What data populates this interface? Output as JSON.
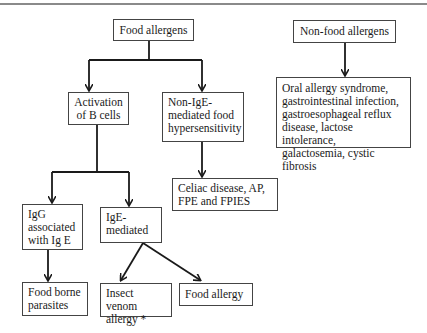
{
  "diagram": {
    "nodes": {
      "food_allergens": "Food allergens",
      "non_food_allergens": "Non-food allergens",
      "activation_b_cells": "Activation\nof B cells",
      "non_ige": "Non-IgE-\nmediated food\nhypersensitivity",
      "non_food_conditions": "Oral allergy syndrome,\ngastrointestinal infection,\ngastroesophageal reflux\ndisease, lactose intolerance,\ngalactosemia, cystic fibrosis",
      "non_ige_conditions": "Celiac disease, AP,\nFPE and FPIES",
      "igg": "IgG\nassociated\nwith Ig E",
      "ige": "IgE-\nmediated",
      "food_borne_parasites": "Food borne\nparasites",
      "insect_venom": "Insect venom\nallergy *",
      "food_allergy": "Food allergy"
    },
    "edges": [
      {
        "from": "Food allergens",
        "to": "Activation of B cells"
      },
      {
        "from": "Food allergens",
        "to": "Non-IgE-mediated food hypersensitivity"
      },
      {
        "from": "Non-food allergens",
        "to": "Oral allergy syndrome, gastrointestinal infection, gastroesophageal reflux disease, lactose intolerance, galactosemia, cystic fibrosis"
      },
      {
        "from": "Non-IgE-mediated food hypersensitivity",
        "to": "Celiac disease, AP, FPE and FPIES"
      },
      {
        "from": "Activation of B cells",
        "to": "IgG associated with Ig E"
      },
      {
        "from": "Activation of B cells",
        "to": "IgE-mediated"
      },
      {
        "from": "IgG associated with Ig E",
        "to": "Food borne parasites"
      },
      {
        "from": "IgE-mediated",
        "to": "Insect venom allergy *"
      },
      {
        "from": "IgE-mediated",
        "to": "Food allergy"
      }
    ],
    "colors": {
      "line": "#1a1a1a",
      "border": "#444444",
      "rule": "#8a8a8a"
    }
  }
}
